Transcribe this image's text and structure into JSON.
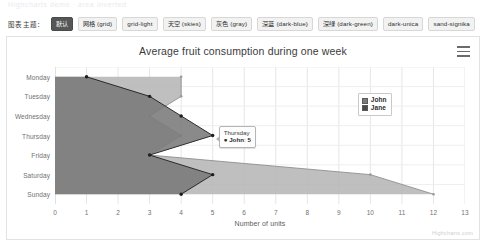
{
  "ghost_row_text": "Highcharts demo  ·  area inverted",
  "theme_selector": {
    "label": "图表主题：",
    "buttons": [
      {
        "label": "默认",
        "active": true
      },
      {
        "label": "网格 (grid)",
        "active": false
      },
      {
        "label": "grid-light",
        "active": false
      },
      {
        "label": "天空 (skies)",
        "active": false
      },
      {
        "label": "灰色 (gray)",
        "active": false
      },
      {
        "label": "深蓝 (dark-blue)",
        "active": false
      },
      {
        "label": "深绿 (dark-green)",
        "active": false
      },
      {
        "label": "dark-unica",
        "active": false
      },
      {
        "label": "sand-signika",
        "active": false
      }
    ]
  },
  "menu_icon": "hamburger-menu-icon",
  "credits": "Highcharts.com",
  "tooltip": {
    "title": "Thursday",
    "bullet": "●",
    "series": "John",
    "separator": ": ",
    "value": "5"
  },
  "legend": {
    "items": [
      {
        "label": "John",
        "color": "#7a7a7a"
      },
      {
        "label": "Jane",
        "color": "#4a4a4a"
      }
    ]
  },
  "chart_data": {
    "type": "area",
    "inverted": true,
    "title": "Average fruit consumption during one week",
    "xlabel": "",
    "ylabel": "Number of units",
    "categories": [
      "Monday",
      "Tuesday",
      "Wednesday",
      "Thursday",
      "Friday",
      "Saturday",
      "Sunday"
    ],
    "ylim": [
      0,
      13
    ],
    "yticks": [
      "0",
      "1",
      "2",
      "3",
      "4",
      "5",
      "6",
      "7",
      "8",
      "9",
      "10",
      "11",
      "12",
      "13"
    ],
    "grid": true,
    "legend_position": "right-top",
    "series": [
      {
        "name": "John",
        "color": "#7a7a7a",
        "values": [
          1,
          3,
          4,
          5,
          3,
          5,
          4
        ]
      },
      {
        "name": "Jane",
        "color": "#b6b6b6",
        "values": [
          4,
          4,
          3,
          4,
          3,
          10,
          12
        ]
      }
    ]
  }
}
